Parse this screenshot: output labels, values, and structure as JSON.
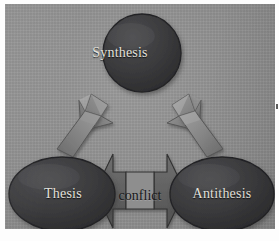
{
  "diagram": {
    "type": "dialectic-triad",
    "background_color": "#8e8e8e",
    "node_fill_color": "#3a3a3c",
    "node_text_color": "#e4e2dd",
    "arrow_fill_color": "#7c7c7c",
    "conflict_text_color": "#17171a",
    "nodes": [
      {
        "id": "synthesis",
        "label": "Synthesis",
        "shape": "circle",
        "position": "top-center"
      },
      {
        "id": "thesis",
        "label": "Thesis",
        "shape": "ellipse",
        "position": "bottom-left"
      },
      {
        "id": "antithesis",
        "label": "Antithesis",
        "shape": "ellipse",
        "position": "bottom-right"
      }
    ],
    "connectors": [
      {
        "id": "thesis-to-synthesis",
        "label": "",
        "shape": "block-arrow",
        "direction": "up-right",
        "from": "thesis",
        "to": "synthesis"
      },
      {
        "id": "antithesis-to-synthesis",
        "label": "",
        "shape": "block-arrow",
        "direction": "up-left",
        "from": "antithesis",
        "to": "synthesis"
      },
      {
        "id": "conflict",
        "label": "conflict",
        "shape": "double-headed-arrow",
        "direction": "bidirectional",
        "from": "thesis",
        "to": "antithesis"
      }
    ]
  }
}
